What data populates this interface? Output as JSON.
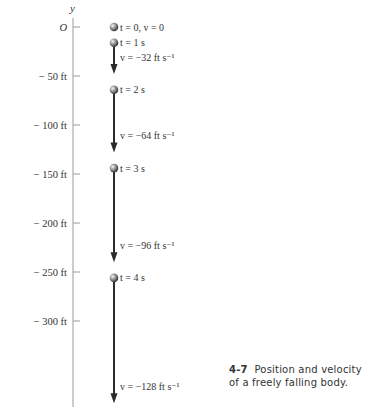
{
  "axis": {
    "label": "y",
    "ticks": [
      {
        "value": 0,
        "label": "O"
      },
      {
        "value": -50,
        "label": "− 50 ft"
      },
      {
        "value": -100,
        "label": "− 100 ft"
      },
      {
        "value": -150,
        "label": "− 150 ft"
      },
      {
        "value": -200,
        "label": "− 200 ft"
      },
      {
        "value": -250,
        "label": "− 250 ft"
      },
      {
        "value": -300,
        "label": "− 300 ft"
      }
    ]
  },
  "positions": [
    {
      "t": 0,
      "y_ft": 0,
      "label": "t = 0,  v = 0",
      "velocity_ft_s": 0,
      "velocity_label": ""
    },
    {
      "t": 1,
      "y_ft": -16,
      "label": "t = 1 s",
      "velocity_ft_s": -32,
      "velocity_label": "v  =  −32 ft s⁻¹"
    },
    {
      "t": 2,
      "y_ft": -64,
      "label": "t = 2 s",
      "velocity_ft_s": -64,
      "velocity_label": "v  =  −64 ft s⁻¹"
    },
    {
      "t": 3,
      "y_ft": -144,
      "label": "t = 3 s",
      "velocity_ft_s": -96,
      "velocity_label": "v  =  −96 ft s⁻¹"
    },
    {
      "t": 4,
      "y_ft": -256,
      "label": "t = 4 s",
      "velocity_ft_s": -128,
      "velocity_label": "v  =  −128 ft s⁻¹"
    }
  ],
  "caption": {
    "number": "4-7",
    "text": "Position and velocity of a freely falling body."
  },
  "colors": {
    "axis": "#9a9a9a",
    "arrow": "#2a2a2a",
    "text": "#333333"
  }
}
